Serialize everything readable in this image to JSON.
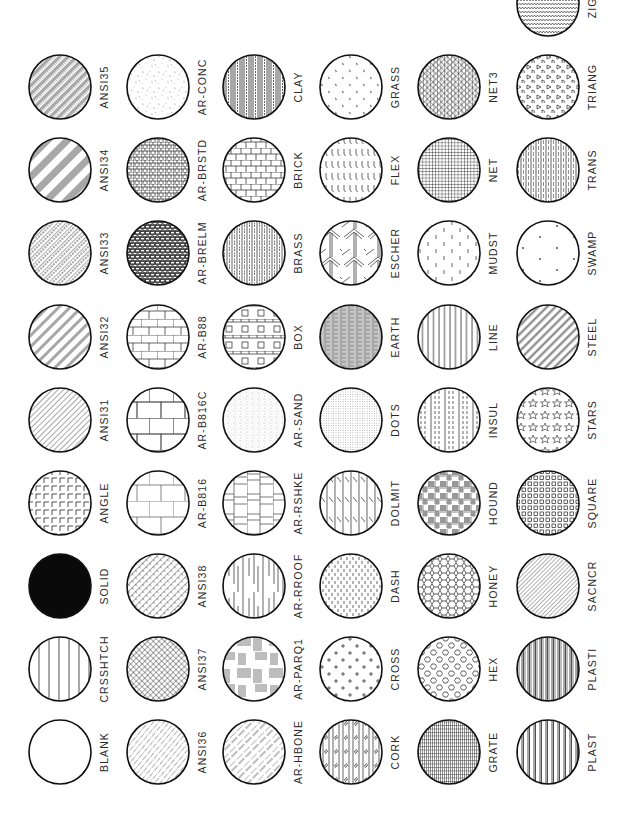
{
  "page": {
    "layout": {
      "column_centers_x": [
        60,
        158,
        254,
        351,
        449,
        548
      ],
      "row_centers_y": [
        4,
        87,
        170,
        253,
        337,
        420,
        503,
        586,
        669,
        752
      ],
      "label_offset_x": 44
    },
    "colors": {
      "ink": "#111111",
      "paper": "#ffffff",
      "label": "#2a2a2a"
    }
  },
  "swatches": [
    {
      "name": "ZIGZ",
      "pattern": "zigzag",
      "row": 0,
      "col": 5
    },
    {
      "name": "ANSI35",
      "pattern": "ansi35",
      "row": 1,
      "col": 0
    },
    {
      "name": "AR-CONC",
      "pattern": "arconc",
      "row": 1,
      "col": 1
    },
    {
      "name": "CLAY",
      "pattern": "clay",
      "row": 1,
      "col": 2
    },
    {
      "name": "GRASS",
      "pattern": "grass",
      "row": 1,
      "col": 3
    },
    {
      "name": "NET3",
      "pattern": "net3",
      "row": 1,
      "col": 4
    },
    {
      "name": "TRIANG",
      "pattern": "triang",
      "row": 1,
      "col": 5
    },
    {
      "name": "ANSI34",
      "pattern": "ansi34",
      "row": 2,
      "col": 0
    },
    {
      "name": "AR-BRSTD",
      "pattern": "arbrstd",
      "row": 2,
      "col": 1
    },
    {
      "name": "BRICK",
      "pattern": "brick",
      "row": 2,
      "col": 2
    },
    {
      "name": "FLEX",
      "pattern": "flex",
      "row": 2,
      "col": 3
    },
    {
      "name": "NET",
      "pattern": "net",
      "row": 2,
      "col": 4
    },
    {
      "name": "TRANS",
      "pattern": "trans",
      "row": 2,
      "col": 5
    },
    {
      "name": "ANSI33",
      "pattern": "ansi33",
      "row": 3,
      "col": 0
    },
    {
      "name": "AR-BRELM",
      "pattern": "arbrelm",
      "row": 3,
      "col": 1
    },
    {
      "name": "BRASS",
      "pattern": "brass",
      "row": 3,
      "col": 2
    },
    {
      "name": "ESCHER",
      "pattern": "escher",
      "row": 3,
      "col": 3
    },
    {
      "name": "MUDST",
      "pattern": "mudst",
      "row": 3,
      "col": 4
    },
    {
      "name": "SWAMP",
      "pattern": "swamp",
      "row": 3,
      "col": 5
    },
    {
      "name": "ANSI32",
      "pattern": "ansi32",
      "row": 4,
      "col": 0
    },
    {
      "name": "AR-B88",
      "pattern": "arb88",
      "row": 4,
      "col": 1
    },
    {
      "name": "BOX",
      "pattern": "box",
      "row": 4,
      "col": 2
    },
    {
      "name": "EARTH",
      "pattern": "earth",
      "row": 4,
      "col": 3
    },
    {
      "name": "LINE",
      "pattern": "line",
      "row": 4,
      "col": 4
    },
    {
      "name": "STEEL",
      "pattern": "steel",
      "row": 4,
      "col": 5
    },
    {
      "name": "ANSI31",
      "pattern": "ansi31",
      "row": 5,
      "col": 0
    },
    {
      "name": "AR-B816C",
      "pattern": "arb816c",
      "row": 5,
      "col": 1
    },
    {
      "name": "AR-SAND",
      "pattern": "arsand",
      "row": 5,
      "col": 2
    },
    {
      "name": "DOTS",
      "pattern": "dots",
      "row": 5,
      "col": 3
    },
    {
      "name": "INSUL",
      "pattern": "insul",
      "row": 5,
      "col": 4
    },
    {
      "name": "STARS",
      "pattern": "stars",
      "row": 5,
      "col": 5
    },
    {
      "name": "ANGLE",
      "pattern": "angle",
      "row": 6,
      "col": 0
    },
    {
      "name": "AR-B816",
      "pattern": "arb816",
      "row": 6,
      "col": 1
    },
    {
      "name": "AR-RSHKE",
      "pattern": "arrshke",
      "row": 6,
      "col": 2
    },
    {
      "name": "DOLMIT",
      "pattern": "dolmit",
      "row": 6,
      "col": 3
    },
    {
      "name": "HOUND",
      "pattern": "hound",
      "row": 6,
      "col": 4
    },
    {
      "name": "SQUARE",
      "pattern": "square",
      "row": 6,
      "col": 5
    },
    {
      "name": "SOLID",
      "pattern": "solid",
      "row": 7,
      "col": 0
    },
    {
      "name": "ANSI38",
      "pattern": "ansi38",
      "row": 7,
      "col": 1
    },
    {
      "name": "AR-RROOF",
      "pattern": "arrroof",
      "row": 7,
      "col": 2
    },
    {
      "name": "DASH",
      "pattern": "dash",
      "row": 7,
      "col": 3
    },
    {
      "name": "HONEY",
      "pattern": "honey",
      "row": 7,
      "col": 4
    },
    {
      "name": "SACNCR",
      "pattern": "sacncr",
      "row": 7,
      "col": 5
    },
    {
      "name": "CRSSHTCH",
      "pattern": "crsshtch",
      "row": 8,
      "col": 0
    },
    {
      "name": "ANSI37",
      "pattern": "ansi37",
      "row": 8,
      "col": 1
    },
    {
      "name": "AR-PARQ1",
      "pattern": "arparq1",
      "row": 8,
      "col": 2
    },
    {
      "name": "CROSS",
      "pattern": "cross",
      "row": 8,
      "col": 3
    },
    {
      "name": "HEX",
      "pattern": "hex",
      "row": 8,
      "col": 4
    },
    {
      "name": "PLASTI",
      "pattern": "plasti",
      "row": 8,
      "col": 5
    },
    {
      "name": "BLANK",
      "pattern": "blank",
      "row": 9,
      "col": 0
    },
    {
      "name": "ANSI36",
      "pattern": "ansi36",
      "row": 9,
      "col": 1
    },
    {
      "name": "AR-HBONE",
      "pattern": "arhbone",
      "row": 9,
      "col": 2
    },
    {
      "name": "CORK",
      "pattern": "cork",
      "row": 9,
      "col": 3
    },
    {
      "name": "GRATE",
      "pattern": "grate",
      "row": 9,
      "col": 4
    },
    {
      "name": "PLAST",
      "pattern": "plast",
      "row": 9,
      "col": 5
    }
  ]
}
